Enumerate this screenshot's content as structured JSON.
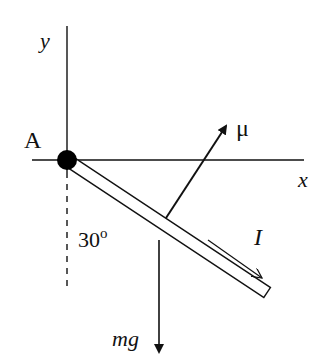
{
  "diagram": {
    "labels": {
      "y_axis": "y",
      "x_axis": "x",
      "pivot": "A",
      "angle": "30",
      "angle_unit": "o",
      "force_mu": "μ",
      "current": "I",
      "weight": "mg"
    },
    "angle_deg": 30,
    "colors": {
      "ink": "#111111",
      "background": "#ffffff"
    }
  }
}
